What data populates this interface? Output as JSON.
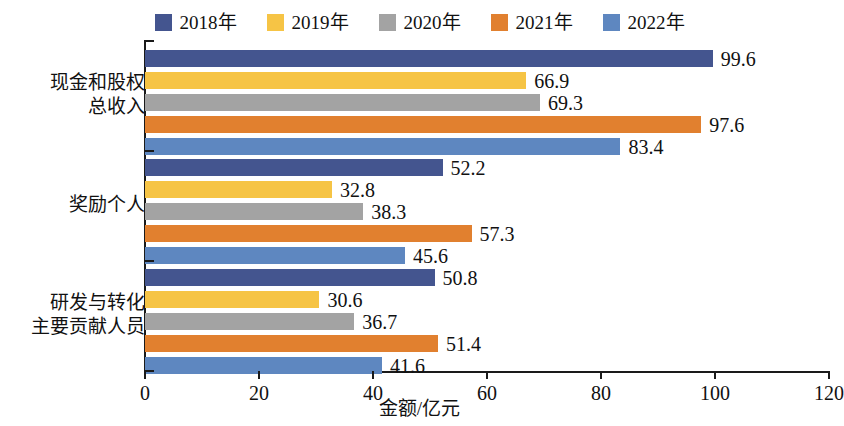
{
  "chart_data": {
    "type": "bar",
    "orientation": "horizontal",
    "title": "",
    "xlabel": "金额/亿元",
    "ylabel": "",
    "xlim": [
      0,
      120
    ],
    "xticks": [
      0,
      20,
      40,
      60,
      80,
      100,
      120
    ],
    "grid": false,
    "legend_position": "top-center",
    "categories": [
      "现金和股权\n总收入",
      "奖励个人",
      "研发与转化\n主要贡献人员"
    ],
    "category_lines": [
      [
        "现金和股权",
        "总收入"
      ],
      [
        "奖励个人"
      ],
      [
        "研发与转化",
        "主要贡献人员"
      ]
    ],
    "series": [
      {
        "name": "2018年",
        "color": "#44558f",
        "values": [
          99.6,
          52.2,
          50.8
        ]
      },
      {
        "name": "2019年",
        "color": "#f5c councils",
        "values": [
          66.9,
          32.8,
          30.6
        ]
      },
      {
        "name": "2020年",
        "color": "#a3a3a3",
        "values": [
          69.3,
          38.3,
          36.7
        ]
      },
      {
        "name": "2021年",
        "color": "#e1802f",
        "values": [
          97.6,
          57.3,
          51.4
        ]
      },
      {
        "name": "2022年",
        "color": "#5e87c0",
        "values": [
          83.4,
          45.6,
          41.6
        ]
      }
    ],
    "value_labels": [
      [
        "99.6",
        "66.9",
        "69.3",
        "97.6",
        "83.4"
      ],
      [
        "52.2",
        "32.8",
        "38.3",
        "57.3",
        "45.6"
      ],
      [
        "50.8",
        "30.6",
        "36.7",
        "51.4",
        "41.6"
      ]
    ]
  },
  "legend": {
    "items": [
      {
        "label": "2018年",
        "color": "#44558f"
      },
      {
        "label": "2019年",
        "color": "#f6c445"
      },
      {
        "label": "2020年",
        "color": "#a3a3a3"
      },
      {
        "label": "2021年",
        "color": "#e1802f"
      },
      {
        "label": "2022年",
        "color": "#5e87c0"
      }
    ]
  },
  "axis": {
    "x_title": "金额/亿元",
    "x_tick_labels": [
      "0",
      "20",
      "40",
      "60",
      "80",
      "100",
      "120"
    ]
  },
  "colors": {
    "axis": "#1a1a1a",
    "text": "#111111",
    "background": "#ffffff",
    "series_2018": "#44558f",
    "series_2019": "#f6c445",
    "series_2020": "#a3a3a3",
    "series_2021": "#e1802f",
    "series_2022": "#5e87c0"
  }
}
